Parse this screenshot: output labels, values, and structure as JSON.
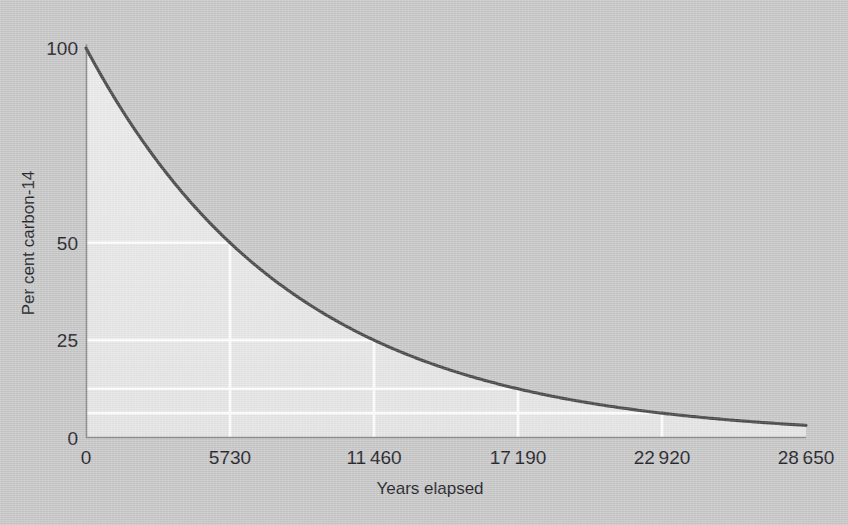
{
  "figure": {
    "background_color": "#c9c9c9",
    "curve_color": "#4a4a4a",
    "fill_color": "#eaeaea",
    "gridline_color": "#ffffff",
    "axis_color": "#8d8d8d",
    "text_color": "#24242a"
  },
  "chart_data": {
    "type": "line",
    "title": "",
    "xlabel": "Years elapsed",
    "ylabel": "Per cent carbon-14",
    "xlim": [
      0,
      28650
    ],
    "ylim": [
      0,
      100
    ],
    "grid": true,
    "legend": "none",
    "half_life_years": 5730,
    "x_tick_values": [
      0,
      5730,
      11460,
      17190,
      22920,
      28650
    ],
    "x_tick_labels": [
      "0",
      "5730",
      "11 460",
      "17 190",
      "22 920",
      "28 650"
    ],
    "y_tick_values": [
      0,
      25,
      50,
      100
    ],
    "y_tick_labels": [
      "0",
      "25",
      "50",
      "100"
    ],
    "gridline_y_values": [
      50,
      25,
      12.5,
      6.25
    ],
    "gridline_x_values": [
      5730,
      11460,
      17190,
      22920
    ],
    "series": [
      {
        "name": "carbon-14 remaining",
        "x": [
          0,
          1432,
          2865,
          4297,
          5730,
          7162,
          8595,
          10027,
          11460,
          12892,
          14325,
          15757,
          17190,
          18622,
          20055,
          21487,
          22920,
          24352,
          25785,
          27217,
          28650
        ],
        "values": [
          100,
          84.1,
          70.7,
          59.5,
          50,
          42.0,
          35.4,
          29.7,
          25,
          21.0,
          17.7,
          14.9,
          12.5,
          10.5,
          8.8,
          7.4,
          6.25,
          5.3,
          4.4,
          3.7,
          3.125
        ]
      }
    ],
    "half_life_points": [
      {
        "x": 0,
        "y": 100,
        "label": "100"
      },
      {
        "x": 5730,
        "y": 50,
        "label": "50"
      },
      {
        "x": 11460,
        "y": 25,
        "label": "25"
      },
      {
        "x": 17190,
        "y": 12.5,
        "label": "12.5"
      },
      {
        "x": 22920,
        "y": 6.25,
        "label": "6.25"
      },
      {
        "x": 28650,
        "y": 3.125,
        "label": "3.125"
      }
    ]
  },
  "axes": {
    "x_title": "Years elapsed",
    "y_title": "Per cent carbon-14",
    "x_ticks": [
      {
        "label": "0",
        "value": 0
      },
      {
        "label": "5730",
        "value": 5730
      },
      {
        "label": "11 460",
        "value": 11460
      },
      {
        "label": "17 190",
        "value": 17190
      },
      {
        "label": "22 920",
        "value": 22920
      },
      {
        "label": "28 650",
        "value": 28650
      }
    ],
    "y_ticks": [
      {
        "label": "0",
        "value": 0
      },
      {
        "label": "25",
        "value": 25
      },
      {
        "label": "50",
        "value": 50
      },
      {
        "label": "100",
        "value": 100
      }
    ]
  }
}
